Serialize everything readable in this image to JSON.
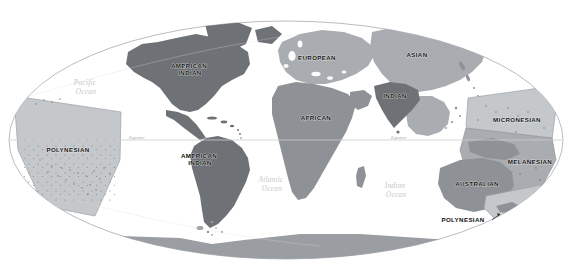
{
  "map": {
    "projection": "Mollweide (oval world projection)",
    "background": "#ffffff",
    "outline_color": "#b9bcc0",
    "equator": {
      "label_left": "Equator",
      "label_right": "Equator",
      "line_color": "#c9ccd0"
    },
    "palette": {
      "dark": "#6e7276",
      "medium": "#8e9296",
      "light": "#a9adb1",
      "pale": "#c4c8cb",
      "antarctica": "#9a9ea2",
      "ocean_text": "#c6c8cb",
      "outline": "#b9bcc0"
    },
    "groups": [
      {
        "id": "american-indian-north",
        "label": "AMERICAN INDIAN",
        "shade": "dark",
        "x": 190,
        "y": 68,
        "line2_dy": 7
      },
      {
        "id": "american-indian-south",
        "label": "AMERICAN INDIAN",
        "shade": "dark",
        "x": 200,
        "y": 158,
        "line2_dy": 7
      },
      {
        "id": "polynesian-east",
        "label": "POLYNESIAN",
        "shade": "pale",
        "x": 68,
        "y": 152
      },
      {
        "id": "european",
        "label": "EUROPEAN",
        "shade": "light",
        "x": 317,
        "y": 60
      },
      {
        "id": "african",
        "label": "AFRICAN",
        "shade": "medium",
        "x": 316,
        "y": 120
      },
      {
        "id": "asian",
        "label": "ASIAN",
        "shade": "light",
        "x": 417,
        "y": 57
      },
      {
        "id": "indian",
        "label": "INDIAN",
        "shade": "dark",
        "x": 395,
        "y": 98
      },
      {
        "id": "micronesian",
        "label": "MICRONESIAN",
        "shade": "pale",
        "x": 517,
        "y": 122
      },
      {
        "id": "melanesian",
        "label": "MELANESIAN",
        "shade": "light",
        "x": 530,
        "y": 164
      },
      {
        "id": "australian",
        "label": "AUSTRALIAN",
        "shade": "medium",
        "x": 477,
        "y": 186
      },
      {
        "id": "polynesian-southwest",
        "label": "POLYNESIAN",
        "shade": "pale",
        "x": 463,
        "y": 222
      }
    ],
    "oceans": [
      {
        "id": "pacific",
        "line1": "Pacific",
        "line2": "Ocean",
        "x": 86,
        "y": 85
      },
      {
        "id": "atlantic",
        "line1": "Atlantic",
        "line2": "Ocean",
        "x": 272,
        "y": 182
      },
      {
        "id": "indian",
        "line1": "Indian",
        "line2": "Ocean",
        "x": 396,
        "y": 188
      }
    ]
  }
}
